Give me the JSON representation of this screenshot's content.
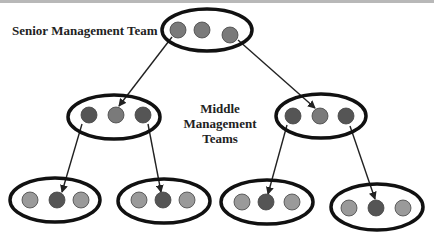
{
  "labels": {
    "senior": "Senior Management Team",
    "middle_line1": "Middle",
    "middle_line2": "Management Teams"
  },
  "colors": {
    "light": "#9a9a9a",
    "mid": "#7a7a7a",
    "dark": "#555555",
    "outline": "#111111"
  },
  "teams": [
    {
      "id": "senior",
      "level": "senior",
      "cx": 207,
      "cy": 30,
      "rx": 45,
      "ry": 21,
      "members": [
        {
          "cx": 178,
          "cy": 30,
          "shade": "mid"
        },
        {
          "cx": 202,
          "cy": 30,
          "shade": "mid"
        },
        {
          "cx": 230,
          "cy": 35,
          "shade": "mid"
        }
      ]
    },
    {
      "id": "middle-left",
      "level": "middle",
      "cx": 114,
      "cy": 117,
      "rx": 46,
      "ry": 22,
      "members": [
        {
          "cx": 89,
          "cy": 115,
          "shade": "dark"
        },
        {
          "cx": 116,
          "cy": 115,
          "shade": "mid"
        },
        {
          "cx": 143,
          "cy": 115,
          "shade": "dark"
        }
      ]
    },
    {
      "id": "middle-right",
      "level": "middle",
      "cx": 321,
      "cy": 116,
      "rx": 45,
      "ry": 22,
      "members": [
        {
          "cx": 293,
          "cy": 116,
          "shade": "dark"
        },
        {
          "cx": 320,
          "cy": 116,
          "shade": "mid"
        },
        {
          "cx": 346,
          "cy": 116,
          "shade": "dark"
        }
      ]
    },
    {
      "id": "bottom-1",
      "level": "front-line",
      "cx": 55,
      "cy": 200,
      "rx": 45,
      "ry": 22,
      "members": [
        {
          "cx": 30,
          "cy": 200,
          "shade": "light"
        },
        {
          "cx": 57,
          "cy": 200,
          "shade": "dark"
        },
        {
          "cx": 81,
          "cy": 200,
          "shade": "light"
        }
      ]
    },
    {
      "id": "bottom-2",
      "level": "front-line",
      "cx": 164,
      "cy": 201,
      "rx": 46,
      "ry": 22,
      "members": [
        {
          "cx": 139,
          "cy": 200,
          "shade": "light"
        },
        {
          "cx": 163,
          "cy": 200,
          "shade": "dark"
        },
        {
          "cx": 187,
          "cy": 200,
          "shade": "light"
        }
      ]
    },
    {
      "id": "bottom-3",
      "level": "front-line",
      "cx": 267,
      "cy": 202,
      "rx": 46,
      "ry": 22,
      "members": [
        {
          "cx": 242,
          "cy": 202,
          "shade": "light"
        },
        {
          "cx": 266,
          "cy": 202,
          "shade": "dark"
        },
        {
          "cx": 292,
          "cy": 202,
          "shade": "light"
        }
      ]
    },
    {
      "id": "bottom-4",
      "level": "front-line",
      "cx": 377,
      "cy": 207,
      "rx": 46,
      "ry": 23,
      "members": [
        {
          "cx": 349,
          "cy": 208,
          "shade": "light"
        },
        {
          "cx": 376,
          "cy": 208,
          "shade": "dark"
        },
        {
          "cx": 403,
          "cy": 208,
          "shade": "light"
        }
      ]
    }
  ],
  "arrows": [
    {
      "from": "senior",
      "x1": 172,
      "y1": 37,
      "x2": 119,
      "y2": 106
    },
    {
      "from": "senior",
      "x1": 238,
      "y1": 40,
      "x2": 315,
      "y2": 108
    },
    {
      "from": "middle-left",
      "x1": 82,
      "y1": 124,
      "x2": 62,
      "y2": 192
    },
    {
      "from": "middle-left",
      "x1": 148,
      "y1": 124,
      "x2": 161,
      "y2": 192
    },
    {
      "from": "middle-right",
      "x1": 287,
      "y1": 125,
      "x2": 268,
      "y2": 194
    },
    {
      "from": "middle-right",
      "x1": 350,
      "y1": 126,
      "x2": 375,
      "y2": 199
    }
  ]
}
